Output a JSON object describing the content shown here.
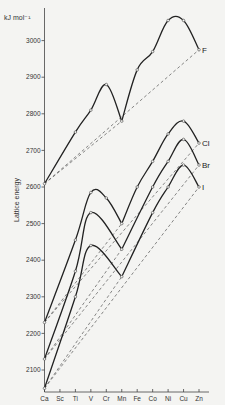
{
  "chart_data": {
    "type": "line",
    "title": "",
    "ylabel": "Lattice energy",
    "yunit": "kJ mol⁻¹",
    "xlabel": "",
    "categories": [
      "Ca",
      "Sc",
      "Ti",
      "V",
      "Cr",
      "Mn",
      "Fe",
      "Co",
      "Ni",
      "Cu",
      "Zn"
    ],
    "yticks": [
      2100,
      2200,
      2300,
      2400,
      2500,
      2600,
      2700,
      2800,
      2900,
      3000
    ],
    "ylim": [
      2050,
      3100
    ],
    "grid": false,
    "legend": "inline labels at right end of curves",
    "series": [
      {
        "name": "F",
        "values": [
          2609,
          null,
          2750,
          2810,
          2880,
          2780,
          2920,
          2970,
          3055,
          3055,
          2975
        ]
      },
      {
        "name": "Cl",
        "values": [
          2230,
          null,
          2455,
          2585,
          2570,
          2500,
          2600,
          2670,
          2745,
          2780,
          2720
        ]
      },
      {
        "name": "Br",
        "values": [
          2130,
          null,
          2370,
          2530,
          null,
          2430,
          null,
          2600,
          2670,
          2730,
          2660
        ]
      },
      {
        "name": "I",
        "values": [
          2050,
          null,
          2300,
          2440,
          null,
          2355,
          null,
          2530,
          2600,
          2660,
          2600
        ]
      }
    ],
    "reference_lines": "dashed straight lines joining Ca, Mn and Zn values for each halide"
  }
}
